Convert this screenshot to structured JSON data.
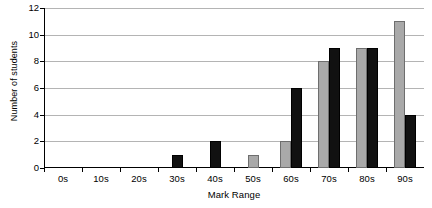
{
  "chart_data": {
    "type": "bar",
    "title": "",
    "xlabel": "Mark Range",
    "ylabel": "Number of students",
    "categories": [
      "0s",
      "10s",
      "20s",
      "30s",
      "40s",
      "50s",
      "60s",
      "70s",
      "80s",
      "90s"
    ],
    "series": [
      {
        "name": "series-grey",
        "color": "#a9a9a9",
        "values": [
          0,
          0,
          0,
          0,
          0,
          1,
          2,
          8,
          9,
          11
        ]
      },
      {
        "name": "series-black",
        "color": "#111111",
        "values": [
          0,
          0,
          0,
          1,
          2,
          0,
          6,
          9,
          9,
          4
        ]
      }
    ],
    "ylim": [
      0,
      12
    ],
    "yticks": [
      0,
      2,
      4,
      6,
      8,
      10,
      12
    ],
    "ytick_labels": [
      "0",
      "2",
      "4",
      "6",
      "8",
      "10",
      "12"
    ],
    "grid": true,
    "legend": false,
    "legend_position": "none",
    "axis_color": "#000000",
    "gridline_color": "#b4b4b4",
    "background": "#ffffff"
  }
}
